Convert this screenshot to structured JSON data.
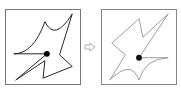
{
  "diagram": {
    "panels": [
      {
        "id": "left",
        "label": "original-shape",
        "stroke": "#222222",
        "dot": "#000000"
      },
      {
        "id": "right",
        "label": "transformed-shape",
        "stroke": "#9a9a9a",
        "dot": "#111111"
      }
    ],
    "arrow": {
      "icon": "right-arrow-icon",
      "color": "#999999"
    }
  }
}
